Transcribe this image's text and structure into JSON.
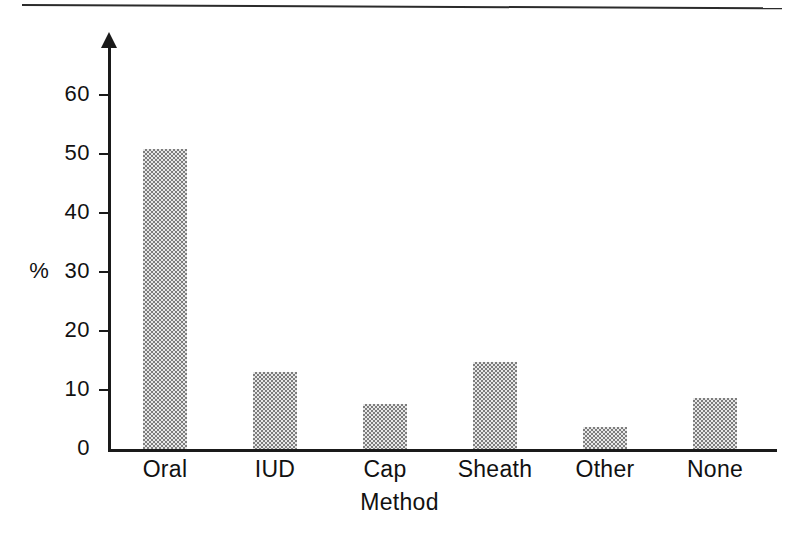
{
  "figure": {
    "top_rule_visible": true,
    "background_color": "#ffffff",
    "ink_color": "#1a1a1a",
    "bar_fill_color": "#8f8f8f"
  },
  "chart_data": {
    "type": "bar",
    "title": "",
    "subtitle": "",
    "xlabel": "Method",
    "ylabel": "%",
    "categories": [
      "Oral",
      "IUD",
      "Cap",
      "Sheath",
      "Other",
      "None"
    ],
    "values": [
      50.8,
      13.0,
      7.7,
      14.7,
      3.7,
      8.7
    ],
    "series": [
      {
        "name": "Percentage of women",
        "values": [
          50.8,
          13.0,
          7.7,
          14.7,
          3.7,
          8.7
        ]
      }
    ],
    "ylim": [
      0,
      67
    ],
    "yticks": [
      0,
      10,
      20,
      30,
      40,
      50,
      60
    ],
    "ytick_labels": [
      "0",
      "10",
      "20",
      "30",
      "40",
      "50",
      "60"
    ],
    "grid": false,
    "legend": null,
    "annotations": [],
    "axis_style": "y-axis arrow-tipped, ticks outward left, no top/right spines"
  }
}
